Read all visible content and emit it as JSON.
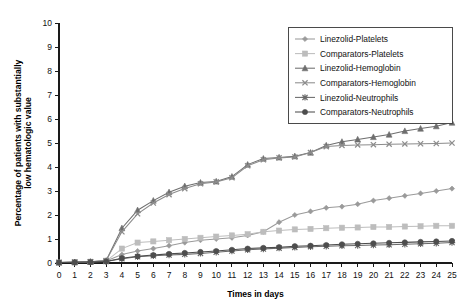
{
  "chart_data": {
    "type": "line",
    "title": "",
    "xlabel": "Times in days",
    "ylabel": "Percentage of patients with substantially low hematologic value",
    "x": [
      0,
      1,
      2,
      3,
      4,
      5,
      6,
      7,
      8,
      9,
      10,
      11,
      12,
      13,
      14,
      15,
      16,
      17,
      18,
      19,
      20,
      21,
      22,
      23,
      24,
      25
    ],
    "xlim": [
      0,
      25
    ],
    "ylim": [
      0,
      10
    ],
    "xticks": [
      "0",
      "1",
      "2",
      "3",
      "4",
      "5",
      "6",
      "7",
      "8",
      "9",
      "10",
      "11",
      "12",
      "13",
      "14",
      "15",
      "16",
      "17",
      "18",
      "19",
      "20",
      "21",
      "22",
      "23",
      "24",
      "25"
    ],
    "yticks": [
      "0",
      "1",
      "2",
      "3",
      "4",
      "5",
      "6",
      "7",
      "8",
      "9",
      "10"
    ],
    "grid": false,
    "legend_position": "top-right",
    "series": [
      {
        "name": "Linezolid-Platelets",
        "marker": "diamond",
        "color": "#9a9a9a",
        "values": [
          0.02,
          0.03,
          0.05,
          0.08,
          0.35,
          0.5,
          0.6,
          0.72,
          0.85,
          0.95,
          1.0,
          1.05,
          1.15,
          1.3,
          1.7,
          2.0,
          2.15,
          2.3,
          2.35,
          2.45,
          2.6,
          2.7,
          2.8,
          2.9,
          3.0,
          3.1
        ]
      },
      {
        "name": "Comparators-Platelets",
        "marker": "square",
        "color": "#bdbdbd",
        "values": [
          0.02,
          0.03,
          0.05,
          0.08,
          0.6,
          0.85,
          0.9,
          0.95,
          1.0,
          1.05,
          1.1,
          1.15,
          1.2,
          1.3,
          1.35,
          1.4,
          1.42,
          1.45,
          1.47,
          1.48,
          1.5,
          1.5,
          1.52,
          1.53,
          1.55,
          1.55
        ]
      },
      {
        "name": "Linezolid-Hemoglobin",
        "marker": "triangle",
        "color": "#6e6e6e",
        "values": [
          0.02,
          0.03,
          0.05,
          0.1,
          1.45,
          2.2,
          2.6,
          2.95,
          3.2,
          3.35,
          3.4,
          3.6,
          4.1,
          4.35,
          4.4,
          4.45,
          4.6,
          4.9,
          5.05,
          5.15,
          5.25,
          5.35,
          5.5,
          5.6,
          5.7,
          5.85
        ]
      },
      {
        "name": "Comparators-Hemoglobin",
        "marker": "cross",
        "color": "#8c8c8c",
        "values": [
          0.02,
          0.03,
          0.05,
          0.1,
          1.3,
          2.05,
          2.5,
          2.85,
          3.1,
          3.3,
          3.38,
          3.55,
          4.05,
          4.3,
          4.38,
          4.42,
          4.6,
          4.85,
          4.9,
          4.92,
          4.93,
          4.95,
          4.96,
          4.97,
          4.98,
          5.0
        ]
      },
      {
        "name": "Linezolid-Neutrophils",
        "marker": "asterisk",
        "color": "#6a6a6a",
        "values": [
          0.02,
          0.03,
          0.04,
          0.06,
          0.18,
          0.26,
          0.3,
          0.33,
          0.36,
          0.4,
          0.45,
          0.5,
          0.55,
          0.58,
          0.62,
          0.65,
          0.68,
          0.7,
          0.72,
          0.73,
          0.75,
          0.76,
          0.78,
          0.8,
          0.82,
          0.85
        ]
      },
      {
        "name": "Comparators-Neutrophils",
        "marker": "circle",
        "color": "#4d4d4d",
        "values": [
          0.02,
          0.03,
          0.04,
          0.06,
          0.2,
          0.28,
          0.33,
          0.38,
          0.42,
          0.46,
          0.5,
          0.55,
          0.6,
          0.63,
          0.66,
          0.7,
          0.72,
          0.75,
          0.78,
          0.8,
          0.82,
          0.84,
          0.86,
          0.88,
          0.9,
          0.92
        ]
      }
    ]
  }
}
